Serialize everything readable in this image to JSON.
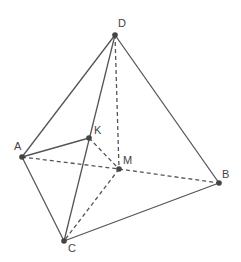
{
  "diagram": {
    "stroke_color": "#555555",
    "point_color": "#444444",
    "points": [
      {
        "label": "D",
        "x": 115,
        "y": 35,
        "lx": 118,
        "ly": 27
      },
      {
        "label": "A",
        "x": 22,
        "y": 157,
        "lx": 14,
        "ly": 150
      },
      {
        "label": "K",
        "x": 89,
        "y": 138,
        "lx": 94,
        "ly": 134
      },
      {
        "label": "M",
        "x": 119,
        "y": 169,
        "lx": 123,
        "ly": 164
      },
      {
        "label": "B",
        "x": 219,
        "y": 183,
        "lx": 222,
        "ly": 178
      },
      {
        "label": "C",
        "x": 64,
        "y": 241,
        "lx": 68,
        "ly": 252
      }
    ],
    "solid_edges": [
      [
        "D",
        "A"
      ],
      [
        "D",
        "B"
      ],
      [
        "D",
        "C"
      ],
      [
        "A",
        "C"
      ],
      [
        "C",
        "B"
      ],
      [
        "A",
        "K"
      ]
    ],
    "dashed_edges": [
      [
        "D",
        "M"
      ],
      [
        "A",
        "M"
      ],
      [
        "M",
        "B"
      ],
      [
        "M",
        "C"
      ],
      [
        "K",
        "M"
      ]
    ]
  }
}
